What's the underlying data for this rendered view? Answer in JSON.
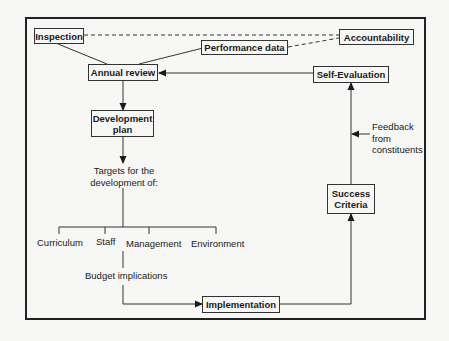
{
  "diagram": {
    "nodes": {
      "inspection": "Inspection",
      "performance_data": "Performance data",
      "accountability": "Accountability",
      "annual_review": "Annual review",
      "self_evaluation": "Self-Evaluation",
      "development_plan_line1": "Development",
      "development_plan_line2": "plan",
      "success_criteria_line1": "Success",
      "success_criteria_line2": "Criteria",
      "implementation": "Implementation"
    },
    "labels": {
      "targets_line1": "Targets for the",
      "targets_line2": "development of:",
      "budget_implications": "Budget implications",
      "feedback_line1": "Feedback",
      "feedback_line2": "from",
      "feedback_line3": "constituents"
    },
    "targets": [
      "Curriculum",
      "Staff",
      "Management",
      "Environment"
    ],
    "edges": [
      {
        "from": "Inspection",
        "to": "Annual review",
        "style": "solid"
      },
      {
        "from": "Performance data",
        "to": "Annual review",
        "style": "solid"
      },
      {
        "from": "Inspection",
        "to": "Accountability",
        "style": "dashed"
      },
      {
        "from": "Performance data",
        "to": "Accountability",
        "style": "dashed"
      },
      {
        "from": "Self-Evaluation",
        "to": "Annual review",
        "style": "arrow"
      },
      {
        "from": "Annual review",
        "to": "Development plan",
        "style": "arrow"
      },
      {
        "from": "Development plan",
        "to": "Targets",
        "style": "arrow"
      },
      {
        "from": "Budget implications",
        "to": "Implementation",
        "style": "arrow"
      },
      {
        "from": "Implementation",
        "to": "Success Criteria",
        "style": "arrow"
      },
      {
        "from": "Success Criteria",
        "to": "Self-Evaluation",
        "style": "arrow"
      },
      {
        "from": "Feedback from constituents",
        "to": "Success-Self-Evaluation link",
        "style": "arrow"
      }
    ]
  }
}
